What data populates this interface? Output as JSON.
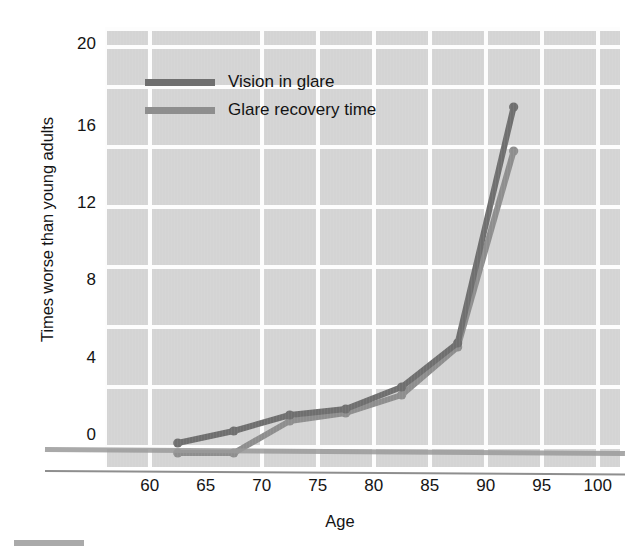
{
  "chart_data": {
    "type": "line",
    "title": "",
    "xlabel": "Age",
    "ylabel": "Times worse than young adults",
    "xlim": [
      56,
      102
    ],
    "ylim": [
      -1,
      21
    ],
    "xticks": [
      60,
      65,
      70,
      75,
      80,
      85,
      90,
      95,
      100
    ],
    "yticks": [
      0,
      4,
      8,
      12,
      16,
      20
    ],
    "grid": true,
    "legend_position": "upper-left-inside",
    "x": [
      62.5,
      67.5,
      72.5,
      77.5,
      82.5,
      87.5,
      92.5
    ],
    "series": [
      {
        "name": "Vision in glare",
        "color": "#6f6f6f",
        "values": [
          0.2,
          0.8,
          1.6,
          1.9,
          3.0,
          5.2,
          17.0
        ]
      },
      {
        "name": "Glare recovery time",
        "color": "#8e8e8e",
        "values": [
          -0.3,
          -0.3,
          1.3,
          1.7,
          2.6,
          5.0,
          14.8
        ]
      }
    ]
  },
  "axis": {
    "y_title": "Times worse than young adults",
    "x_title": "Age",
    "y_tick_labels": [
      "20",
      "16",
      "12",
      "8",
      "4",
      "0"
    ],
    "x_tick_labels": [
      "60",
      "65",
      "70",
      "75",
      "80",
      "85",
      "90",
      "95",
      "100"
    ]
  },
  "legend": {
    "entries": [
      {
        "label": "Vision in glare",
        "color": "#6f6f6f"
      },
      {
        "label": "Glare recovery time",
        "color": "#8e8e8e"
      }
    ]
  },
  "colors": {
    "plot_background": "#d4d4d4",
    "gridline": "#fdfdfd",
    "page_background": "#ffffff",
    "text": "#141414",
    "series_1": "#6f6f6f",
    "series_2": "#8e8e8e"
  }
}
